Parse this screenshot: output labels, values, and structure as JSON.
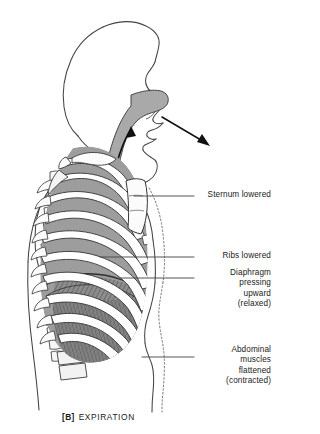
{
  "figure": {
    "title_caption": {
      "tag": "[B]",
      "text": "EXPIRATION"
    },
    "colors": {
      "outline": "#3b3b3b",
      "rib_fill": "#ffffff",
      "intercostal_gray": "#9a9a9a",
      "airway_gray": "#a8a8a8",
      "diaphragm_dark": "#6e6e6e",
      "leader_line": "#4a4a4a",
      "text": "#1a1a1a",
      "dashed_outline": "#6b6b6b"
    },
    "labels": [
      {
        "id": "sternum",
        "lines": [
          "Sternum lowered"
        ]
      },
      {
        "id": "ribs",
        "lines": [
          "Ribs lowered"
        ]
      },
      {
        "id": "diaphragm",
        "lines": [
          "Diaphragm",
          "pressing",
          "upward",
          "(relaxed)"
        ]
      },
      {
        "id": "abdominal",
        "lines": [
          "Abdominal",
          "muscles",
          "flattened",
          "(contracted)"
        ]
      }
    ],
    "airflow": {
      "direction": "outward",
      "mouth_arrow": "exhaled-air-leaving-mouth",
      "trachea_arrow": "air-moving-up-trachea"
    }
  }
}
